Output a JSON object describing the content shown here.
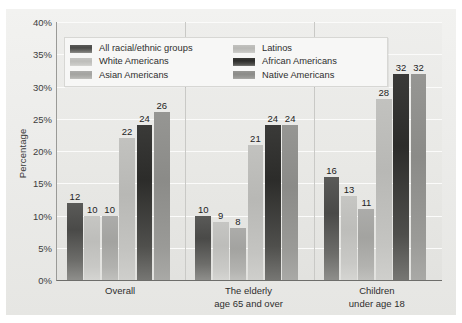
{
  "chart_data": {
    "type": "bar",
    "title": "",
    "subtitle": "",
    "xlabel": "",
    "ylabel": "Percentage",
    "ylim": [
      0,
      40
    ],
    "ytick_step": 5,
    "ytick_labels": [
      "0%",
      "5%",
      "10%",
      "15%",
      "20%",
      "25%",
      "30%",
      "35%",
      "40%"
    ],
    "ytick_values": [
      0,
      5,
      10,
      15,
      20,
      25,
      30,
      35,
      40
    ],
    "grid": "horizontal",
    "legend_position": "top-left-inside",
    "categories": [
      "Overall",
      "The elderly age 65 and over",
      "Children under age 18"
    ],
    "category_lines": [
      [
        "Overall"
      ],
      [
        "The elderly",
        "age 65 and over"
      ],
      [
        "Children",
        "under age 18"
      ]
    ],
    "series": [
      {
        "name": "All racial/ethnic groups",
        "color": "#4a4a48",
        "values": [
          12,
          10,
          16
        ]
      },
      {
        "name": "White Americans",
        "color": "#bdbdba",
        "values": [
          10,
          9,
          13
        ]
      },
      {
        "name": "Asian Americans",
        "color": "#a3a3a0",
        "values": [
          10,
          8,
          11
        ]
      },
      {
        "name": "Latinos",
        "color": "#b8b8b5",
        "values": [
          22,
          21,
          28
        ]
      },
      {
        "name": "African Americans",
        "color": "#2c2c2a",
        "values": [
          24,
          24,
          32
        ]
      },
      {
        "name": "Native Americans",
        "color": "#8b8b88",
        "values": [
          26,
          24,
          32
        ]
      }
    ],
    "legend_columns": [
      [
        "All racial/ethnic groups",
        "White Americans",
        "Asian Americans"
      ],
      [
        "Latinos",
        "African Americans",
        "Native Americans"
      ]
    ],
    "data_labels": [
      [
        12,
        10,
        10,
        22,
        24,
        26
      ],
      [
        10,
        9,
        8,
        21,
        24,
        24
      ],
      [
        16,
        13,
        11,
        28,
        32,
        32
      ]
    ]
  },
  "colors": {
    "plot_background": "#e9e9e6",
    "page_background": "#ffffff",
    "gridline": "#fbfbfa",
    "axis": "#6e6e6b",
    "legend_background": "#f7f7f6",
    "text": "#2e2e2e"
  }
}
